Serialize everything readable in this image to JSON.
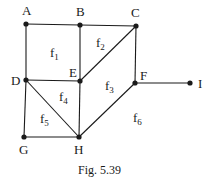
{
  "diagram": {
    "caption": "Fig. 5.39",
    "line_color": "#1a1a1a",
    "nodes": [
      {
        "id": "A",
        "x": 26,
        "y": 24,
        "lx": 22,
        "ly": 15
      },
      {
        "id": "B",
        "x": 80,
        "y": 25,
        "lx": 76,
        "ly": 16
      },
      {
        "id": "C",
        "x": 136,
        "y": 26,
        "lx": 131,
        "ly": 17
      },
      {
        "id": "D",
        "x": 26,
        "y": 80,
        "lx": 11,
        "ly": 85
      },
      {
        "id": "E",
        "x": 80,
        "y": 81,
        "lx": 69,
        "ly": 77
      },
      {
        "id": "F",
        "x": 135,
        "y": 83,
        "lx": 140,
        "ly": 80
      },
      {
        "id": "I",
        "x": 190,
        "y": 83,
        "lx": 198,
        "ly": 88
      },
      {
        "id": "G",
        "x": 24,
        "y": 137,
        "lx": 19,
        "ly": 154
      },
      {
        "id": "H",
        "x": 79,
        "y": 137,
        "lx": 74,
        "ly": 154
      }
    ],
    "edges": [
      [
        "A",
        "B"
      ],
      [
        "B",
        "C"
      ],
      [
        "A",
        "D"
      ],
      [
        "B",
        "E"
      ],
      [
        "C",
        "E"
      ],
      [
        "C",
        "F"
      ],
      [
        "D",
        "E"
      ],
      [
        "D",
        "G"
      ],
      [
        "D",
        "H"
      ],
      [
        "E",
        "H"
      ],
      [
        "G",
        "H"
      ],
      [
        "F",
        "H"
      ],
      [
        "F",
        "I"
      ]
    ],
    "faces": [
      {
        "label": "f",
        "sub": "1",
        "x": 50,
        "y": 57
      },
      {
        "label": "f",
        "sub": "2",
        "x": 96,
        "y": 47
      },
      {
        "label": "f",
        "sub": "3",
        "x": 105,
        "y": 90
      },
      {
        "label": "f",
        "sub": "4",
        "x": 59,
        "y": 101
      },
      {
        "label": "f",
        "sub": "5",
        "x": 40,
        "y": 123
      },
      {
        "label": "f",
        "sub": "6",
        "x": 133,
        "y": 122
      }
    ]
  }
}
